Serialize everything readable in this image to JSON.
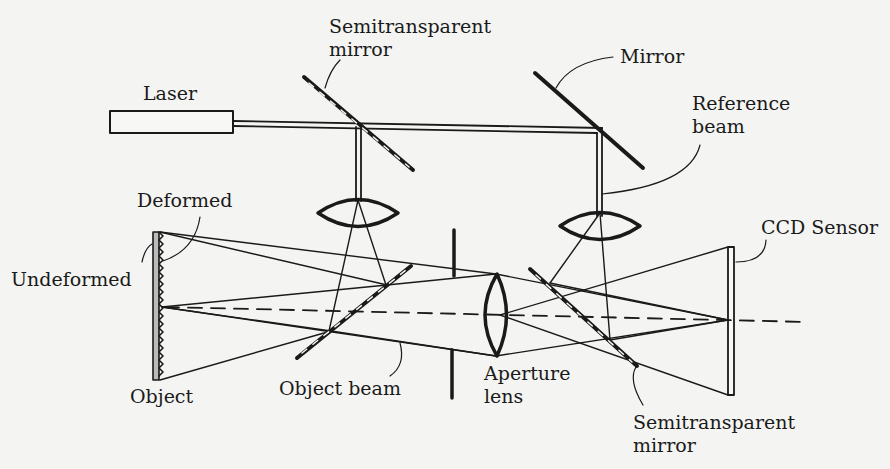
{
  "diagram": {
    "type": "optical-setup",
    "colors": {
      "background": "#f4f4f2",
      "ink": "#1a1a1a"
    },
    "labels": {
      "laser": "Laser",
      "semi_mirror_top_line1": "Semitransparent",
      "semi_mirror_top_line2": "mirror",
      "mirror": "Mirror",
      "reference_beam_line1": "Reference",
      "reference_beam_line2": "beam",
      "deformed": "Deformed",
      "undeformed": "Undeformed",
      "object": "Object",
      "object_beam": "Object beam",
      "aperture_line1": "Aperture",
      "aperture_line2": "lens",
      "ccd_sensor": "CCD Sensor",
      "semi_mirror_bottom_line1": "Semitransparent",
      "semi_mirror_bottom_line2": "mirror"
    },
    "components": [
      "laser",
      "semitransparent-mirror-beam-splitter",
      "mirror",
      "lens-object-illumination",
      "lens-reference",
      "object",
      "semitransparent-mirror-object-side",
      "aperture",
      "aperture-lens",
      "semitransparent-mirror-sensor-side",
      "ccd-sensor",
      "optical-axis"
    ]
  }
}
